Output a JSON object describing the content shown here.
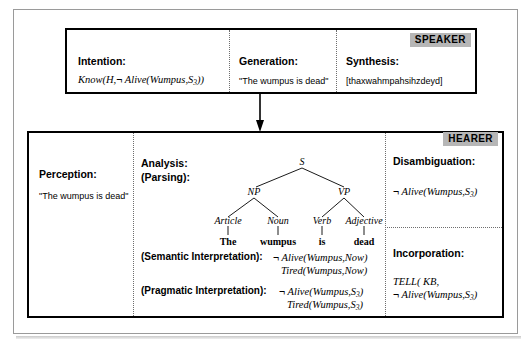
{
  "speaker": {
    "badge": "SPEAKER",
    "columns": [
      {
        "header": "Intention:",
        "value": "Know(H,¬ Alive(Wumpus,S3))"
      },
      {
        "header": "Generation:",
        "value": "\"The wumpus is dead\""
      },
      {
        "header": "Synthesis:",
        "value": "[thaxwahmpahsihzdeyd]"
      }
    ]
  },
  "hearer": {
    "badge": "HEARER",
    "perception": {
      "header": "Perception:",
      "value": "\"The wumpus is dead\""
    },
    "analysis": {
      "header_line1": "Analysis:",
      "header_line2": "(Parsing):",
      "semantic_label": "(Semantic Interpretation):",
      "semantic_line1": "¬ Alive(Wumpus,Now)",
      "semantic_line2": "Tired(Wumpus,Now)",
      "pragmatic_label": "(Pragmatic Interpretation):",
      "pragmatic_line1": "¬ Alive(Wumpus,S3)",
      "pragmatic_line2": "Tired(Wumpus,S3)"
    },
    "disambiguation": {
      "header": "Disambiguation:",
      "value": "¬ Alive(Wumpus,S3)"
    },
    "incorporation": {
      "header": "Incorporation:",
      "line1": "TELL( KB,",
      "line2": "¬ Alive(Wumpus,S3)"
    }
  },
  "parse_tree": {
    "nodes": [
      "S",
      "NP",
      "VP",
      "Article",
      "Noun",
      "Verb",
      "Adjective"
    ],
    "leaves": [
      "The",
      "wumpus",
      "is",
      "dead"
    ]
  },
  "colors": {
    "badge_bg": "#b6b6b6",
    "frame": "#9a9a9a",
    "box_border": "#000000"
  }
}
